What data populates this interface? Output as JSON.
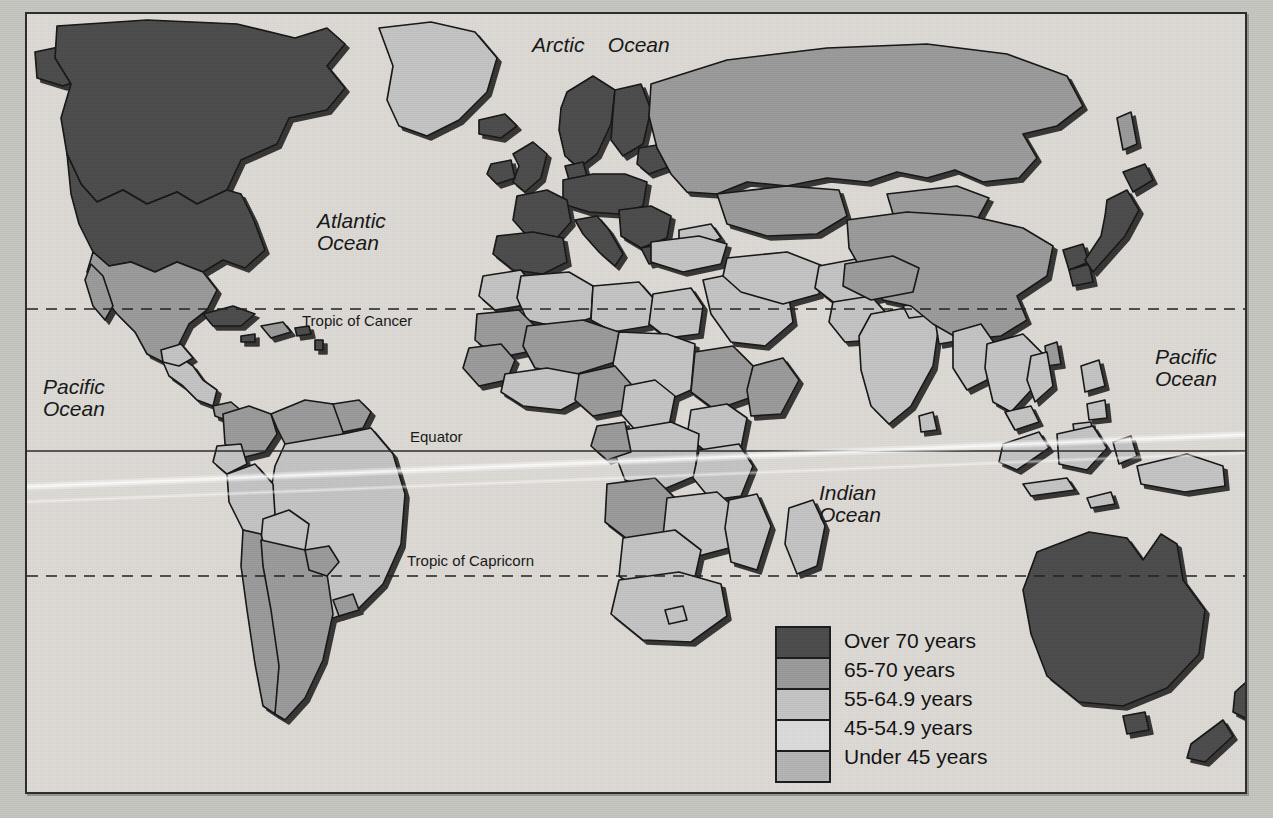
{
  "map": {
    "title": "World life expectancy at birth",
    "projection": "world",
    "ocean_color": "#dedbd6",
    "frame_color": "#2b2b2b"
  },
  "ocean_labels": [
    {
      "name": "arctic-ocean",
      "text": "Arctic    Ocean",
      "x": 530,
      "y": 22,
      "width": 190
    },
    {
      "name": "atlantic-ocean",
      "text": "Atlantic\nOcean",
      "x": 315,
      "y": 212,
      "width": 130
    },
    {
      "name": "pacific-ocean-west",
      "text": "Pacific\nOcean",
      "x": 40,
      "y": 375,
      "width": 110
    },
    {
      "name": "pacific-ocean-east",
      "text": "Pacific\nOcean",
      "x": 1152,
      "y": 345,
      "width": 110
    },
    {
      "name": "indian-ocean",
      "text": "Indian\nOcean",
      "x": 816,
      "y": 480,
      "width": 110
    }
  ],
  "latitude_lines": [
    {
      "name": "tropic-of-cancer",
      "label": "Tropic of Cancer",
      "style": "dashed",
      "y": 307,
      "label_x": 300,
      "label_y": 313
    },
    {
      "name": "equator",
      "label": "Equator",
      "style": "solid",
      "y": 449,
      "label_x": 408,
      "label_y": 428
    },
    {
      "name": "tropic-of-capricorn",
      "label": "Tropic of Capricorn",
      "style": "dashed",
      "y": 574,
      "label_x": 405,
      "label_y": 553
    }
  ],
  "legend": {
    "title": "",
    "items": [
      {
        "label": "Over 70 years",
        "color": "#4b4b4b",
        "range_min": 70,
        "range_max": null
      },
      {
        "label": "65-70 years",
        "color": "#9a9a9a",
        "range_min": 65,
        "range_max": 70
      },
      {
        "label": "55-64.9 years",
        "color": "#c4c4c4",
        "range_min": 55,
        "range_max": 64.9
      },
      {
        "label": "45-54.9 years",
        "color": "#dcdcdc",
        "range_min": 45,
        "range_max": 54.9
      },
      {
        "label": "Under 45 years",
        "color": "#b4b4b4",
        "range_min": null,
        "range_max": 45
      }
    ]
  },
  "regions": [
    {
      "name": "canada",
      "category": 0
    },
    {
      "name": "united-states",
      "category": 0
    },
    {
      "name": "greenland",
      "category": 2
    },
    {
      "name": "mexico",
      "category": 1
    },
    {
      "name": "central-america",
      "category": 2
    },
    {
      "name": "caribbean",
      "category": 1
    },
    {
      "name": "venezuela-colombia",
      "category": 1
    },
    {
      "name": "brazil",
      "category": 2
    },
    {
      "name": "peru-bolivia",
      "category": 2
    },
    {
      "name": "argentina-chile",
      "category": 1
    },
    {
      "name": "western-europe",
      "category": 0
    },
    {
      "name": "eastern-europe",
      "category": 0
    },
    {
      "name": "russia",
      "category": 1
    },
    {
      "name": "north-africa",
      "category": 2
    },
    {
      "name": "west-africa",
      "category": 4
    },
    {
      "name": "central-africa",
      "category": 3
    },
    {
      "name": "east-africa",
      "category": 3
    },
    {
      "name": "southern-africa",
      "category": 2
    },
    {
      "name": "middle-east",
      "category": 2
    },
    {
      "name": "india",
      "category": 2
    },
    {
      "name": "china",
      "category": 1
    },
    {
      "name": "japan",
      "category": 0
    },
    {
      "name": "korea",
      "category": 0
    },
    {
      "name": "southeast-asia",
      "category": 2
    },
    {
      "name": "indonesia",
      "category": 2
    },
    {
      "name": "australia",
      "category": 0
    },
    {
      "name": "new-zealand",
      "category": 0
    }
  ],
  "bleed_text": [
    {
      "text": "Copyright material",
      "x": 155,
      "y": 260
    },
    {
      "text": "of the publisher",
      "x": 300,
      "y": 330
    },
    {
      "text": "not for resale",
      "x": 600,
      "y": 355
    },
    {
      "text": "LIFE EXPECTANCY",
      "x": 640,
      "y": 300
    },
    {
      "text": "reproduction",
      "x": 180,
      "y": 545
    },
    {
      "text": "human geography",
      "x": 260,
      "y": 660
    }
  ]
}
